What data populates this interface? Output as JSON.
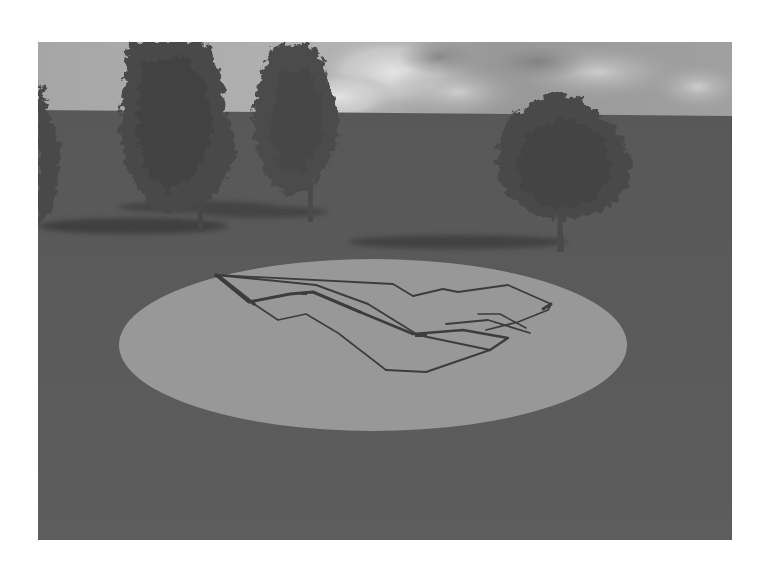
{
  "scene": {
    "description": "Grayscale 3D render of a building floor plan outline on a circular ground disc with trees in the background",
    "colors": {
      "page_background": "#ffffff",
      "sky_light": "#c8c8c8",
      "sky_mid": "#a9a9a9",
      "sky_dark": "#8e8e8e",
      "cloud": "#e2e2e2",
      "ground": "#5a5a5a",
      "ground_far": "#565656",
      "disc": "#9a9a9a",
      "plan_line": "#3a3a3a",
      "tree_foliage": "#474747",
      "tree_foliage_dark": "#3c3c3c",
      "tree_shadow": "#3f3f3f",
      "trunk": "#4a4a4a"
    },
    "frame": {
      "x": 38,
      "y": 42,
      "width": 694,
      "height": 498
    },
    "horizon": {
      "left_y": 68,
      "right_y": 74
    },
    "disc": {
      "cx": 335,
      "cy": 303,
      "rx": 254,
      "ry": 86
    },
    "trees": [
      {
        "name": "left-edge-tree",
        "x": 0
      },
      {
        "name": "tall-tree-1",
        "x": 140
      },
      {
        "name": "tall-tree-2",
        "x": 280
      },
      {
        "name": "round-tree",
        "x": 522
      }
    ]
  }
}
